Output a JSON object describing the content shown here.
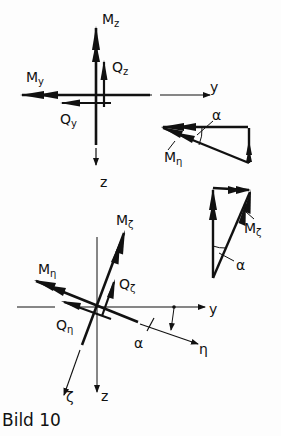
{
  "caption": "Bild 10",
  "colors": {
    "ink": "#111111",
    "background": "#fdfdfd"
  },
  "top_figure": {
    "axes": {
      "y": "y",
      "z": "z"
    },
    "vectors": [
      {
        "id": "Mz",
        "main": "M",
        "sub": "z"
      },
      {
        "id": "Qz",
        "main": "Q",
        "sub": "z"
      },
      {
        "id": "My",
        "main": "M",
        "sub": "y"
      },
      {
        "id": "Qy",
        "main": "Q",
        "sub": "y"
      }
    ]
  },
  "triangle_eta": {
    "angle": "α",
    "resultant": {
      "main": "M",
      "sub": "η"
    }
  },
  "triangle_zeta": {
    "angle": "α",
    "resultant": {
      "main": "M",
      "sub": "ζ"
    }
  },
  "bottom_figure": {
    "axes": {
      "y": "y",
      "z": "z",
      "eta": "η",
      "zeta": "ζ"
    },
    "angle": "α",
    "vectors": [
      {
        "id": "Mzeta",
        "main": "M",
        "sub": "ζ"
      },
      {
        "id": "Qzeta",
        "main": "Q",
        "sub": "ζ"
      },
      {
        "id": "Meta",
        "main": "M",
        "sub": "η"
      },
      {
        "id": "Qeta",
        "main": "Q",
        "sub": "η"
      }
    ]
  }
}
